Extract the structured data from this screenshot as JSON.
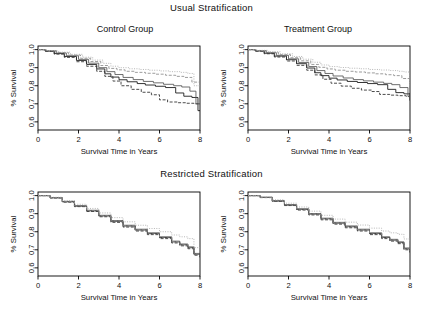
{
  "figure": {
    "sections": [
      {
        "key": "usual",
        "title": "Usual Stratification"
      },
      {
        "key": "restricted",
        "title": "Restricted Stratification"
      }
    ],
    "panel_titles": {
      "control": "Control Group",
      "treatment": "Treatment Group"
    }
  },
  "axes": {
    "xlabel": "Survival Time in Years",
    "ylabel": "% Survival",
    "xticks": [
      "0",
      "2",
      "4",
      "6",
      "8"
    ],
    "yticks": [
      "0.6",
      "0.7",
      "0.8",
      "0.9",
      "1.0"
    ],
    "xlim": [
      0,
      8
    ],
    "ylim": [
      0.555,
      1.02
    ]
  },
  "style": {
    "axis_color": "#000000",
    "series_colors": [
      "#111111",
      "#2b2b2b",
      "#555555",
      "#8a8a8a",
      "#aaaaaa"
    ],
    "background": "#ffffff"
  },
  "chart_data": [
    {
      "type": "line",
      "id": "usual-control",
      "title": "Control Group",
      "section": "Usual Stratification",
      "xlabel": "Survival Time in Years",
      "ylabel": "% Survival",
      "xlim": [
        0,
        8
      ],
      "ylim": [
        0.555,
        1.02
      ],
      "xticks": [
        0,
        2,
        4,
        6,
        8
      ],
      "yticks": [
        0.6,
        0.7,
        0.8,
        0.9,
        1.0
      ],
      "grid": false,
      "legend": "none",
      "curve_style": "kaplan-meier-step",
      "series": [
        {
          "name": "Stratum 1",
          "dash": "solid",
          "color": "#111111",
          "x": [
            0,
            0.35,
            0.8,
            1.3,
            1.9,
            2.4,
            2.9,
            3.3,
            3.6,
            4.0,
            4.4,
            4.9,
            5.3,
            5.8,
            6.3,
            6.8,
            7.2,
            7.6,
            7.9,
            8.0
          ],
          "y": [
            1.0,
            0.992,
            0.978,
            0.962,
            0.94,
            0.918,
            0.893,
            0.866,
            0.848,
            0.833,
            0.822,
            0.812,
            0.804,
            0.797,
            0.79,
            0.76,
            0.742,
            0.735,
            0.662,
            0.66
          ]
        },
        {
          "name": "Stratum 2",
          "dash": "dashed",
          "color": "#2b2b2b",
          "x": [
            0,
            0.35,
            0.8,
            1.3,
            1.9,
            2.4,
            2.9,
            3.3,
            3.7,
            4.1,
            4.6,
            5.1,
            5.6,
            6.0,
            6.4,
            6.9,
            7.3,
            7.7,
            8.0
          ],
          "y": [
            1.0,
            0.99,
            0.975,
            0.957,
            0.933,
            0.908,
            0.88,
            0.852,
            0.826,
            0.8,
            0.78,
            0.764,
            0.75,
            0.722,
            0.71,
            0.706,
            0.703,
            0.7,
            0.699
          ]
        },
        {
          "name": "Stratum 3",
          "dash": "solid",
          "color": "#555555",
          "x": [
            0,
            0.4,
            0.9,
            1.4,
            2.0,
            2.5,
            3.0,
            3.4,
            3.8,
            4.2,
            4.7,
            5.2,
            5.7,
            6.2,
            6.7,
            7.1,
            7.5,
            7.8,
            8.0
          ],
          "y": [
            1.0,
            0.993,
            0.981,
            0.966,
            0.946,
            0.925,
            0.9,
            0.878,
            0.862,
            0.846,
            0.834,
            0.824,
            0.816,
            0.808,
            0.8,
            0.793,
            0.77,
            0.7,
            0.697
          ]
        },
        {
          "name": "Stratum 4",
          "dash": "dashed",
          "color": "#8a8a8a",
          "x": [
            0,
            0.4,
            0.9,
            1.5,
            2.1,
            2.6,
            3.1,
            3.5,
            3.9,
            4.3,
            4.8,
            5.3,
            5.8,
            6.3,
            6.8,
            7.2,
            7.6,
            8.0
          ],
          "y": [
            1.0,
            0.994,
            0.984,
            0.97,
            0.952,
            0.934,
            0.912,
            0.896,
            0.888,
            0.88,
            0.874,
            0.869,
            0.864,
            0.858,
            0.852,
            0.846,
            0.82,
            0.812
          ]
        },
        {
          "name": "Stratum 5",
          "dash": "dotted",
          "color": "#aaaaaa",
          "x": [
            0,
            0.45,
            1.0,
            1.6,
            2.2,
            2.7,
            3.2,
            3.6,
            4.0,
            4.5,
            5.0,
            5.5,
            6.0,
            6.5,
            7.0,
            7.4,
            7.7,
            8.0
          ],
          "y": [
            1.0,
            0.995,
            0.986,
            0.974,
            0.958,
            0.942,
            0.924,
            0.908,
            0.9,
            0.894,
            0.89,
            0.886,
            0.882,
            0.878,
            0.874,
            0.868,
            0.8,
            0.792
          ]
        }
      ]
    },
    {
      "type": "line",
      "id": "usual-treatment",
      "title": "Treatment Group",
      "section": "Usual Stratification",
      "xlabel": "Survival Time in Years",
      "ylabel": "% Survival",
      "xlim": [
        0,
        8
      ],
      "ylim": [
        0.555,
        1.02
      ],
      "xticks": [
        0,
        2,
        4,
        6,
        8
      ],
      "yticks": [
        0.6,
        0.7,
        0.8,
        0.9,
        1.0
      ],
      "grid": false,
      "legend": "none",
      "curve_style": "kaplan-meier-step",
      "series": [
        {
          "name": "Stratum 1",
          "dash": "solid",
          "color": "#111111",
          "x": [
            0,
            0.35,
            0.8,
            1.3,
            1.9,
            2.4,
            2.9,
            3.3,
            3.6,
            4.0,
            4.4,
            4.9,
            5.4,
            5.9,
            6.4,
            6.9,
            7.3,
            7.7,
            8.0
          ],
          "y": [
            1.0,
            0.993,
            0.98,
            0.964,
            0.944,
            0.922,
            0.898,
            0.872,
            0.856,
            0.842,
            0.832,
            0.824,
            0.818,
            0.812,
            0.806,
            0.78,
            0.762,
            0.755,
            0.718
          ]
        },
        {
          "name": "Stratum 2",
          "dash": "dashed",
          "color": "#2b2b2b",
          "x": [
            0,
            0.35,
            0.8,
            1.3,
            1.9,
            2.4,
            2.9,
            3.3,
            3.7,
            4.1,
            4.6,
            5.1,
            5.6,
            6.1,
            6.5,
            7.0,
            7.4,
            7.8,
            8.0
          ],
          "y": [
            1.0,
            0.991,
            0.977,
            0.959,
            0.937,
            0.913,
            0.886,
            0.86,
            0.836,
            0.814,
            0.798,
            0.786,
            0.776,
            0.768,
            0.752,
            0.748,
            0.745,
            0.742,
            0.74
          ]
        },
        {
          "name": "Stratum 3",
          "dash": "solid",
          "color": "#555555",
          "x": [
            0,
            0.4,
            0.9,
            1.4,
            2.0,
            2.5,
            3.0,
            3.4,
            3.8,
            4.2,
            4.7,
            5.2,
            5.7,
            6.2,
            6.7,
            7.1,
            7.5,
            7.9,
            8.0
          ],
          "y": [
            1.0,
            0.994,
            0.983,
            0.968,
            0.949,
            0.929,
            0.906,
            0.884,
            0.868,
            0.854,
            0.843,
            0.834,
            0.827,
            0.82,
            0.813,
            0.806,
            0.79,
            0.74,
            0.722
          ]
        },
        {
          "name": "Stratum 4",
          "dash": "dashed",
          "color": "#8a8a8a",
          "x": [
            0,
            0.4,
            0.9,
            1.5,
            2.1,
            2.6,
            3.1,
            3.5,
            3.9,
            4.3,
            4.8,
            5.3,
            5.8,
            6.3,
            6.8,
            7.2,
            7.6,
            8.0
          ],
          "y": [
            1.0,
            0.995,
            0.985,
            0.972,
            0.955,
            0.938,
            0.918,
            0.902,
            0.893,
            0.886,
            0.88,
            0.876,
            0.871,
            0.866,
            0.861,
            0.856,
            0.84,
            0.748
          ]
        },
        {
          "name": "Stratum 5",
          "dash": "dotted",
          "color": "#aaaaaa",
          "x": [
            0,
            0.45,
            1.0,
            1.6,
            2.2,
            2.7,
            3.2,
            3.6,
            4.0,
            4.5,
            5.0,
            5.5,
            6.0,
            6.5,
            7.0,
            7.4,
            7.7,
            8.0
          ],
          "y": [
            1.0,
            0.996,
            0.988,
            0.977,
            0.962,
            0.947,
            0.93,
            0.915,
            0.906,
            0.901,
            0.897,
            0.894,
            0.89,
            0.887,
            0.884,
            0.88,
            0.876,
            0.8
          ]
        }
      ]
    },
    {
      "type": "line",
      "id": "restricted-control",
      "title": "",
      "section": "Restricted Stratification",
      "xlabel": "Survival Time in Years",
      "ylabel": "% Survival",
      "xlim": [
        0,
        8
      ],
      "ylim": [
        0.555,
        1.02
      ],
      "xticks": [
        0,
        2,
        4,
        6,
        8
      ],
      "yticks": [
        0.6,
        0.7,
        0.8,
        0.9,
        1.0
      ],
      "grid": false,
      "legend": "none",
      "curve_style": "kaplan-meier-step",
      "series": [
        {
          "name": "Stratum 1",
          "dash": "solid",
          "color": "#111111",
          "x": [
            0,
            0.6,
            1.2,
            1.8,
            2.4,
            3.0,
            3.6,
            4.2,
            4.8,
            5.4,
            6.0,
            6.6,
            7.0,
            7.4,
            7.7,
            8.0
          ],
          "y": [
            1.0,
            0.988,
            0.966,
            0.942,
            0.916,
            0.888,
            0.858,
            0.832,
            0.81,
            0.79,
            0.768,
            0.744,
            0.728,
            0.712,
            0.676,
            0.66
          ]
        },
        {
          "name": "Stratum 2",
          "dash": "dashed",
          "color": "#2b2b2b",
          "x": [
            0,
            0.6,
            1.2,
            1.8,
            2.4,
            3.0,
            3.6,
            4.2,
            4.8,
            5.4,
            6.0,
            6.6,
            7.0,
            7.4,
            7.7,
            8.0
          ],
          "y": [
            1.0,
            0.987,
            0.964,
            0.939,
            0.912,
            0.883,
            0.852,
            0.826,
            0.804,
            0.784,
            0.762,
            0.738,
            0.722,
            0.706,
            0.67,
            0.654
          ]
        },
        {
          "name": "Stratum 3",
          "dash": "solid",
          "color": "#555555",
          "x": [
            0,
            0.6,
            1.2,
            1.8,
            2.4,
            3.0,
            3.6,
            4.2,
            4.8,
            5.4,
            6.0,
            6.6,
            7.0,
            7.4,
            7.7,
            8.0
          ],
          "y": [
            1.0,
            0.989,
            0.968,
            0.944,
            0.919,
            0.891,
            0.862,
            0.836,
            0.814,
            0.794,
            0.772,
            0.748,
            0.732,
            0.716,
            0.68,
            0.664
          ]
        },
        {
          "name": "Stratum 4",
          "dash": "dashed",
          "color": "#8a8a8a",
          "x": [
            0,
            0.6,
            1.2,
            1.8,
            2.4,
            3.0,
            3.6,
            4.2,
            4.8,
            5.4,
            6.0,
            6.6,
            7.0,
            7.4,
            7.7,
            8.0
          ],
          "y": [
            1.0,
            0.988,
            0.967,
            0.943,
            0.917,
            0.889,
            0.86,
            0.834,
            0.812,
            0.792,
            0.77,
            0.746,
            0.73,
            0.714,
            0.678,
            0.662
          ]
        },
        {
          "name": "Stratum 5",
          "dash": "dotted",
          "color": "#aaaaaa",
          "x": [
            0,
            0.6,
            1.2,
            1.8,
            2.4,
            3.0,
            3.6,
            4.2,
            4.8,
            5.4,
            6.0,
            6.6,
            7.0,
            7.4,
            7.7,
            8.0
          ],
          "y": [
            1.0,
            0.991,
            0.973,
            0.952,
            0.929,
            0.904,
            0.878,
            0.855,
            0.836,
            0.818,
            0.8,
            0.782,
            0.772,
            0.762,
            0.712,
            0.698
          ]
        }
      ]
    },
    {
      "type": "line",
      "id": "restricted-treatment",
      "title": "",
      "section": "Restricted Stratification",
      "xlabel": "Survival Time in Years",
      "ylabel": "% Survival",
      "xlim": [
        0,
        8
      ],
      "ylim": [
        0.555,
        1.02
      ],
      "xticks": [
        0,
        2,
        4,
        6,
        8
      ],
      "yticks": [
        0.6,
        0.7,
        0.8,
        0.9,
        1.0
      ],
      "grid": false,
      "legend": "none",
      "curve_style": "kaplan-meier-step",
      "series": [
        {
          "name": "Stratum 1",
          "dash": "solid",
          "color": "#111111",
          "x": [
            0,
            0.6,
            1.2,
            1.8,
            2.4,
            3.0,
            3.6,
            4.2,
            4.8,
            5.4,
            6.0,
            6.6,
            7.0,
            7.4,
            7.7,
            8.0
          ],
          "y": [
            1.0,
            0.99,
            0.97,
            0.948,
            0.924,
            0.898,
            0.872,
            0.848,
            0.828,
            0.81,
            0.79,
            0.768,
            0.754,
            0.74,
            0.706,
            0.69
          ]
        },
        {
          "name": "Stratum 2",
          "dash": "dashed",
          "color": "#2b2b2b",
          "x": [
            0,
            0.6,
            1.2,
            1.8,
            2.4,
            3.0,
            3.6,
            4.2,
            4.8,
            5.4,
            6.0,
            6.6,
            7.0,
            7.4,
            7.7,
            8.0
          ],
          "y": [
            1.0,
            0.989,
            0.968,
            0.945,
            0.92,
            0.893,
            0.866,
            0.842,
            0.822,
            0.804,
            0.784,
            0.762,
            0.748,
            0.734,
            0.7,
            0.684
          ]
        },
        {
          "name": "Stratum 3",
          "dash": "solid",
          "color": "#555555",
          "x": [
            0,
            0.6,
            1.2,
            1.8,
            2.4,
            3.0,
            3.6,
            4.2,
            4.8,
            5.4,
            6.0,
            6.6,
            7.0,
            7.4,
            7.7,
            8.0
          ],
          "y": [
            1.0,
            0.991,
            0.972,
            0.95,
            0.927,
            0.901,
            0.875,
            0.852,
            0.832,
            0.814,
            0.794,
            0.772,
            0.758,
            0.744,
            0.71,
            0.694
          ]
        },
        {
          "name": "Stratum 4",
          "dash": "dashed",
          "color": "#8a8a8a",
          "x": [
            0,
            0.6,
            1.2,
            1.8,
            2.4,
            3.0,
            3.6,
            4.2,
            4.8,
            5.4,
            6.0,
            6.6,
            7.0,
            7.4,
            7.7,
            8.0
          ],
          "y": [
            1.0,
            0.99,
            0.971,
            0.949,
            0.925,
            0.899,
            0.873,
            0.85,
            0.83,
            0.812,
            0.792,
            0.77,
            0.756,
            0.742,
            0.708,
            0.692
          ]
        },
        {
          "name": "Stratum 5",
          "dash": "dotted",
          "color": "#aaaaaa",
          "x": [
            0,
            0.6,
            1.2,
            1.8,
            2.4,
            3.0,
            3.6,
            4.2,
            4.8,
            5.4,
            6.0,
            6.6,
            7.0,
            7.4,
            7.7,
            8.0
          ],
          "y": [
            1.0,
            0.993,
            0.977,
            0.958,
            0.937,
            0.914,
            0.891,
            0.87,
            0.853,
            0.837,
            0.82,
            0.804,
            0.794,
            0.786,
            0.76,
            0.748
          ]
        }
      ]
    }
  ]
}
